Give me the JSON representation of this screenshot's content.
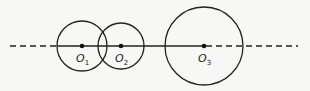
{
  "diagram": {
    "line": {
      "y": 46,
      "dashed_left": [
        10,
        57
      ],
      "solid": [
        57,
        204
      ],
      "dashed_right": [
        204,
        298
      ]
    },
    "circles": [
      {
        "id": "O1",
        "label": "O",
        "sub": "1",
        "cx": 82,
        "cy": 46,
        "r": 25
      },
      {
        "id": "O2",
        "label": "O",
        "sub": "2",
        "cx": 121,
        "cy": 46,
        "r": 23
      },
      {
        "id": "O3",
        "label": "O",
        "sub": "3",
        "cx": 204,
        "cy": 46,
        "r": 39
      }
    ],
    "colors": {
      "stroke": "#222222",
      "background": "#f7f7f5"
    }
  }
}
